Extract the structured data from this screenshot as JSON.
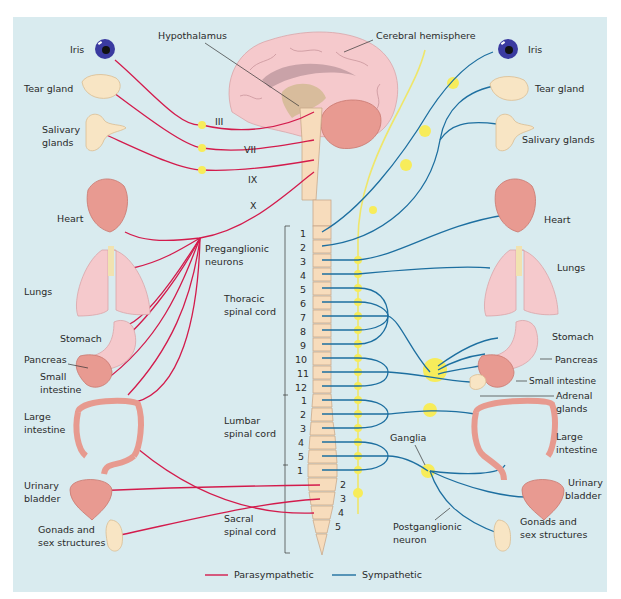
{
  "figure": {
    "type": "autonomic-nervous-system-diagram",
    "colors": {
      "background": "#d9ebef",
      "parasympathetic": "#d31b4c",
      "sympathetic": "#1d6fa0",
      "ganglion": "#f7ec5a",
      "spinal_cord": "#f7dcbc"
    }
  },
  "brain": {
    "hypothalamus": "Hypothalamus",
    "cerebral_hemisphere": "Cerebral hemisphere"
  },
  "left_organs": {
    "iris": "Iris",
    "tear_gland": "Tear gland",
    "salivary_line1": "Salivary",
    "salivary_line2": "glands",
    "heart": "Heart",
    "lungs": "Lungs",
    "stomach": "Stomach",
    "pancreas": "Pancreas",
    "small_intestine_line1": "Small",
    "small_intestine_line2": "intestine",
    "large_intestine_line1": "Large",
    "large_intestine_line2": "intestine",
    "urinary_line1": "Urinary",
    "urinary_line2": "bladder",
    "gonads_line1": "Gonads and",
    "gonads_line2": "sex structures"
  },
  "right_organs": {
    "iris": "Iris",
    "tear_gland": "Tear gland",
    "salivary": "Salivary glands",
    "heart": "Heart",
    "lungs": "Lungs",
    "stomach": "Stomach",
    "pancreas": "Pancreas",
    "small_intestine": "Small intestine",
    "adrenal_line1": "Adrenal",
    "adrenal_line2": "glands",
    "large_intestine_line1": "Large",
    "large_intestine_line2": "intestine",
    "urinary_line1": "Urinary",
    "urinary_line2": "bladder",
    "gonads_line1": "Gonads and",
    "gonads_line2": "sex structures"
  },
  "cranial_nerves": [
    "III",
    "VII",
    "IX",
    "X"
  ],
  "annotations": {
    "preganglionic_line1": "Preganglionic",
    "preganglionic_line2": "neurons",
    "ganglia": "Ganglia",
    "postganglionic_line1": "Postganglionic",
    "postganglionic_line2": "neuron"
  },
  "spinal_regions": {
    "thoracic_line1": "Thoracic",
    "thoracic_line2": "spinal cord",
    "lumbar_line1": "Lumbar",
    "lumbar_line2": "spinal cord",
    "sacral_line1": "Sacral",
    "sacral_line2": "spinal cord"
  },
  "segments": {
    "thoracic": [
      "1",
      "2",
      "3",
      "4",
      "5",
      "6",
      "7",
      "8",
      "9",
      "10",
      "11",
      "12"
    ],
    "lumbar": [
      "1",
      "2",
      "3",
      "4",
      "5"
    ],
    "sacral": [
      "1",
      "2",
      "3",
      "4",
      "5"
    ]
  },
  "legend": {
    "parasympathetic": "Parasympathetic",
    "sympathetic": "Sympathetic"
  }
}
